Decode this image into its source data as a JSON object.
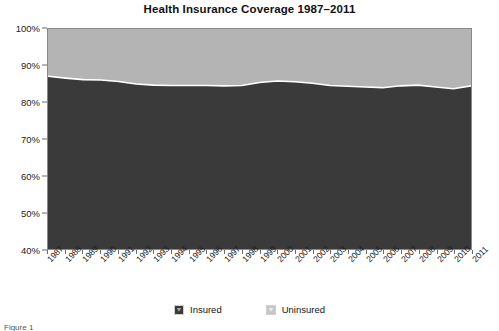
{
  "chart_data": {
    "type": "area",
    "title": "Health Insurance Coverage 1987–2011",
    "xlabel": "",
    "ylabel": "",
    "ylim": [
      40,
      100
    ],
    "ytick_labels": [
      "100%",
      "90%",
      "80%",
      "70%",
      "60%",
      "50%",
      "40%"
    ],
    "ytick_values": [
      100,
      90,
      80,
      70,
      60,
      50,
      40
    ],
    "grid": false,
    "stacked": true,
    "stack_total": 100,
    "legend_position": "bottom-center",
    "categories": [
      "1987",
      "1988",
      "1989",
      "1990",
      "1991",
      "1992",
      "1993",
      "1994",
      "1995",
      "1996",
      "1997",
      "1998",
      "1999",
      "2000",
      "2001",
      "2002",
      "2003",
      "2004",
      "2005",
      "2006",
      "2007",
      "2008",
      "2009",
      "2010",
      "2011"
    ],
    "series": [
      {
        "name": "Insured",
        "color": "#3a3a3a",
        "values": [
          87.1,
          86.6,
          86.2,
          86.1,
          85.7,
          85.0,
          84.7,
          84.6,
          84.6,
          84.6,
          84.5,
          84.6,
          85.4,
          85.8,
          85.6,
          85.2,
          84.6,
          84.4,
          84.2,
          84.0,
          84.5,
          84.7,
          84.2,
          83.7,
          84.5
        ]
      },
      {
        "name": "Uninsured",
        "color": "#b4b4b4",
        "values": [
          12.9,
          13.4,
          13.8,
          13.9,
          14.3,
          15.0,
          15.3,
          15.4,
          15.4,
          15.4,
          15.5,
          15.4,
          14.6,
          14.2,
          14.4,
          14.8,
          15.4,
          15.6,
          15.8,
          16.0,
          15.5,
          15.3,
          15.8,
          16.3,
          15.5
        ]
      }
    ]
  },
  "legend": {
    "items": [
      {
        "label": "Insured",
        "color": "#3a3a3a"
      },
      {
        "label": "Uninsured",
        "color": "#b4b4b4"
      }
    ]
  },
  "caption": {
    "text": "Figure 1"
  }
}
